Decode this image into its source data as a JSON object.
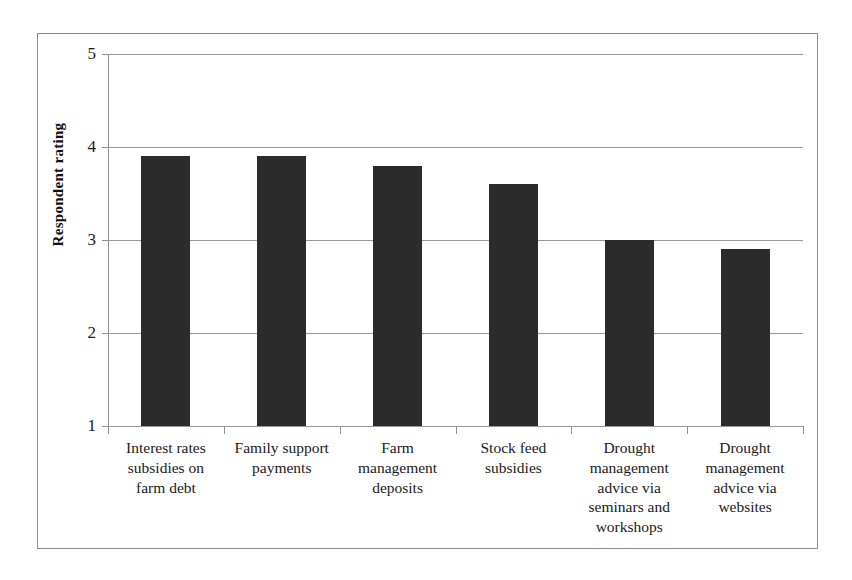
{
  "chart_data": {
    "type": "bar",
    "title": "",
    "xlabel": "",
    "ylabel": "Respondent rating",
    "ylim": [
      1,
      5
    ],
    "yticks": [
      "1",
      "2",
      "3",
      "4",
      "5"
    ],
    "grid": true,
    "legend": false,
    "bar_color": "#2b2b2b",
    "categories": [
      "Interest rates subsidies on farm debt",
      "Family support payments",
      "Farm management deposits",
      "Stock feed subsidies",
      "Drought management advice via seminars and workshops",
      "Drought management advice via websites"
    ],
    "category_lines": [
      [
        "Interest rates",
        "subsidies on",
        "farm debt"
      ],
      [
        "Family support",
        "payments"
      ],
      [
        "Farm",
        "management",
        "deposits"
      ],
      [
        "Stock feed",
        "subsidies"
      ],
      [
        "Drought",
        "management",
        "advice via",
        "seminars and",
        "workshops"
      ],
      [
        "Drought",
        "management",
        "advice via",
        "websites"
      ]
    ],
    "values": [
      3.9,
      3.9,
      3.8,
      3.6,
      3.0,
      2.9
    ]
  },
  "axis": {
    "y_title": "Respondent rating",
    "y_tick_5": "5",
    "y_tick_4": "4",
    "y_tick_3": "3",
    "y_tick_2": "2",
    "y_tick_1": "1"
  },
  "categories_text": {
    "cat0_line0": "Interest rates",
    "cat0_line1": "subsidies on",
    "cat0_line2": "farm debt",
    "cat1_line0": "Family support",
    "cat1_line1": "payments",
    "cat2_line0": "Farm",
    "cat2_line1": "management",
    "cat2_line2": "deposits",
    "cat3_line0": "Stock feed",
    "cat3_line1": "subsidies",
    "cat4_line0": "Drought",
    "cat4_line1": "management",
    "cat4_line2": "advice via",
    "cat4_line3": "seminars and",
    "cat4_line4": "workshops",
    "cat5_line0": "Drought",
    "cat5_line1": "management",
    "cat5_line2": "advice via",
    "cat5_line3": "websites"
  }
}
